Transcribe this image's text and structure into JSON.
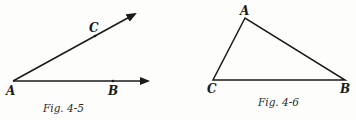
{
  "figures": [
    {
      "caption": "Fig. 4-5",
      "points": {
        "A": "A",
        "B": "B",
        "C": "C"
      },
      "description": "Angle formed by two rays from A, one through C, one through B"
    },
    {
      "caption": "Fig. 4-6",
      "points": {
        "A": "A",
        "B": "B",
        "C": "C"
      },
      "description": "Triangle ABC"
    }
  ],
  "colors": {
    "ink": "#1a1a1a",
    "paper": "#fdfdfb"
  }
}
